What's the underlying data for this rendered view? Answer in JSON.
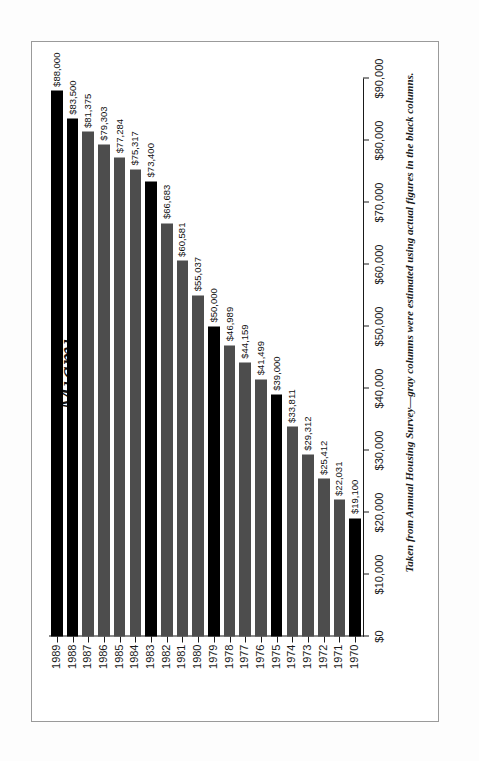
{
  "figure": {
    "title": "Miami",
    "footnote": "Taken from Annual Housing Survey—gray columns were estimated using actual figures in the black columns."
  },
  "axis": {
    "value_ticks": [
      "$0",
      "$10,000",
      "$20,000",
      "$30,000",
      "$40,000",
      "$50,000",
      "$60,000",
      "$70,000",
      "$80,000",
      "$90,000"
    ],
    "category_ticks": [
      "1970",
      "1971",
      "1972",
      "1973",
      "1974",
      "1975",
      "1976",
      "1977",
      "1978",
      "1979",
      "1980",
      "1981",
      "1982",
      "1983",
      "1984",
      "1985",
      "1986",
      "1987",
      "1988",
      "1989"
    ]
  },
  "legend": {
    "black_label": "actual figures",
    "gray_label": "estimated"
  },
  "colors": {
    "black_bar": "#000000",
    "gray_bar": "#4d4d4d",
    "axis": "#1a1a1a",
    "frame": "#9a9a9a",
    "page": "#ffffff"
  },
  "chart_data": {
    "type": "bar",
    "title": "Miami",
    "subtitle": "",
    "xlabel": "",
    "ylabel": "",
    "ylim": [
      0,
      90000
    ],
    "ytick_step": 10000,
    "grid": false,
    "legend_position": "none",
    "orientation": "vertical-printed-sideways",
    "categories": [
      "1970",
      "1971",
      "1972",
      "1973",
      "1974",
      "1975",
      "1976",
      "1977",
      "1978",
      "1979",
      "1980",
      "1981",
      "1982",
      "1983",
      "1984",
      "1985",
      "1986",
      "1987",
      "1988",
      "1989"
    ],
    "values": [
      19100,
      22031,
      25412,
      29312,
      33811,
      39000,
      41499,
      44159,
      46989,
      50000,
      55037,
      60581,
      66683,
      73400,
      75317,
      77284,
      79303,
      81375,
      83500,
      88000
    ],
    "value_labels": [
      "$19,100",
      "$22,031",
      "$25,412",
      "$29,312",
      "$33,811",
      "$39,000",
      "$41,499",
      "$44,159",
      "$46,989",
      "$50,000",
      "$55,037",
      "$60,581",
      "$66,683",
      "$73,400",
      "$75,317",
      "$77,284",
      "$79,303",
      "$81,375",
      "$83,500",
      "$88,000"
    ],
    "series_kind": [
      "black",
      "gray",
      "gray",
      "gray",
      "gray",
      "black",
      "gray",
      "gray",
      "gray",
      "black",
      "gray",
      "gray",
      "gray",
      "black",
      "gray",
      "gray",
      "gray",
      "gray",
      "black",
      "black"
    ],
    "annotations": [
      "Taken from Annual Housing Survey—gray columns were estimated using actual figures in the black columns."
    ]
  }
}
